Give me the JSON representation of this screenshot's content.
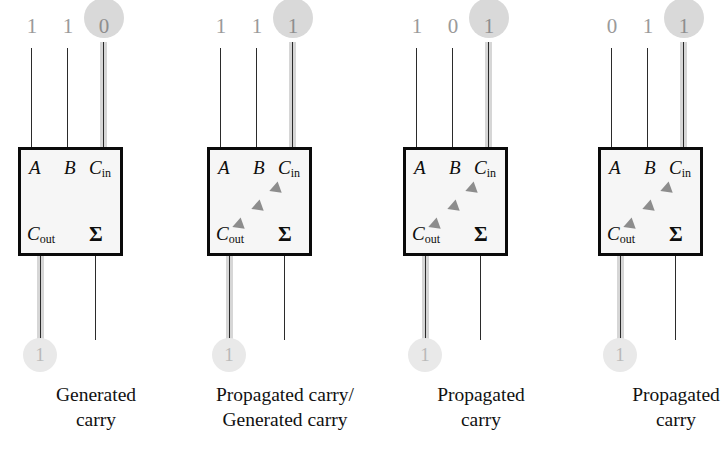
{
  "diagram": {
    "colors": {
      "box_fill": "#f6f6f6",
      "box_border": "#0a0a0a",
      "wire": "#2b2b2b",
      "highlight_stripe": "#d6d6d6",
      "bubble": "#d9d9d9",
      "bubble_faint": "#e9e9e9",
      "arrow": "#8d8d8d",
      "value_text": "#9a9a9a",
      "caption_text": "#111111"
    },
    "pin_labels": {
      "a": "A",
      "b": "B",
      "cin_main": "C",
      "cin_sub": "in",
      "cout_main": "C",
      "cout_sub": "out",
      "sum": "Σ"
    },
    "cells": [
      {
        "id": "adder-1",
        "inputs": {
          "a": "1",
          "b": "1",
          "cin": "0"
        },
        "cin_highlighted": true,
        "carry_arrow": false,
        "output_cout": "1",
        "caption_lines": [
          "Generated",
          "carry"
        ]
      },
      {
        "id": "adder-2",
        "inputs": {
          "a": "1",
          "b": "1",
          "cin": "1"
        },
        "cin_highlighted": true,
        "carry_arrow": true,
        "output_cout": "1",
        "caption_lines": [
          "Propagated carry/",
          "Generated carry"
        ]
      },
      {
        "id": "adder-3",
        "inputs": {
          "a": "1",
          "b": "0",
          "cin": "1"
        },
        "cin_highlighted": true,
        "carry_arrow": true,
        "output_cout": "1",
        "caption_lines": [
          "Propagated",
          "carry"
        ]
      },
      {
        "id": "adder-4",
        "inputs": {
          "a": "0",
          "b": "1",
          "cin": "1"
        },
        "cin_highlighted": true,
        "carry_arrow": true,
        "output_cout": "1",
        "caption_lines": [
          "Propagated",
          "carry"
        ]
      }
    ]
  }
}
